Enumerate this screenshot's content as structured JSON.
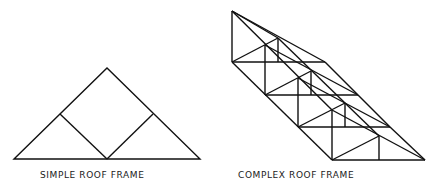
{
  "diagram": {
    "simple": {
      "caption": "SIMPLE ROOF FRAME"
    },
    "complex": {
      "caption": "COMPLEX ROOF FRAME"
    },
    "stroke_color": "#111111",
    "background": "#ffffff"
  }
}
